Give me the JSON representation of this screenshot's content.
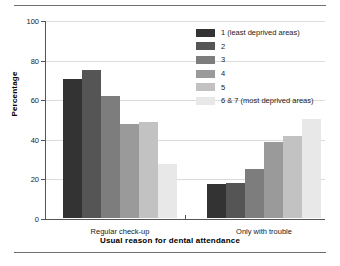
{
  "chart_data": {
    "type": "bar",
    "title": "",
    "subtitle": "",
    "xlabel": "Usual reason for dental attendance",
    "ylabel": "Percentage",
    "categories": [
      "Regular check-up",
      "Only with trouble"
    ],
    "ylim": [
      0,
      100
    ],
    "yticks": [
      0,
      20,
      40,
      60,
      80,
      100
    ],
    "ytick_labels": [
      "0",
      "20",
      "40",
      "60",
      "80",
      "100"
    ],
    "grid": "horizontal",
    "legend_position": "top-right",
    "series": [
      {
        "name": "1 (least deprived areas)",
        "color": "#333333",
        "values": [
          70,
          17
        ]
      },
      {
        "name": "2",
        "color": "#555555",
        "values": [
          75,
          17.5
        ]
      },
      {
        "name": "3",
        "color": "#7d7d7d",
        "values": [
          61.5,
          25
        ]
      },
      {
        "name": "4",
        "color": "#9a9a9a",
        "values": [
          47.5,
          38.5
        ]
      },
      {
        "name": "5",
        "color": "#c2c2c2",
        "values": [
          48.5,
          41.5
        ]
      },
      {
        "name": "6 & 7 (most deprived areas)",
        "color": "#e8e8e8",
        "values": [
          27.5,
          50
        ]
      }
    ]
  },
  "axes": {
    "y_title": "Percentage",
    "x_title": "Usual reason for dental attendance",
    "y_tick_0": "0",
    "y_tick_1": "20",
    "y_tick_2": "40",
    "y_tick_3": "60",
    "y_tick_4": "80",
    "y_tick_5": "100",
    "x_label_0": "Regular check-up",
    "x_label_1": "Only with trouble"
  },
  "legend": {
    "items": [
      {
        "label": "1 (least deprived areas)",
        "color": "#333333"
      },
      {
        "label": "2",
        "color": "#555555"
      },
      {
        "label": "3",
        "color": "#7d7d7d"
      },
      {
        "label": "4",
        "color": "#9a9a9a"
      },
      {
        "label": "5",
        "color": "#c2c2c2"
      },
      {
        "label": "6 & 7 (most deprived areas)",
        "color": "#e8e8e8"
      }
    ]
  }
}
